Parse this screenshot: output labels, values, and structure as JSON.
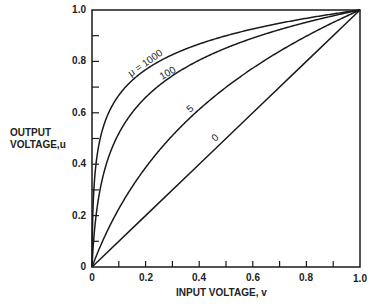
{
  "chart_data": {
    "type": "line",
    "title": "",
    "xlabel": "INPUT VOLTAGE, v",
    "ylabel_lines": [
      "OUTPUT",
      "VOLTAGE,u"
    ],
    "ylabel": "OUTPUT VOLTAGE,u",
    "xlim": [
      0,
      1.0
    ],
    "ylim": [
      0,
      1.0
    ],
    "grid": false,
    "legend": "inline curve labels",
    "x_ticks": [
      "0",
      "0.2",
      "0.4",
      "0.6",
      "0.8",
      "1.0"
    ],
    "y_ticks": [
      "0",
      "0.2",
      "0.4",
      "0.6",
      "0.8",
      "1.0"
    ],
    "minor_tick_step": 0.1,
    "series": [
      {
        "name": "0",
        "label": "0",
        "mu": 0,
        "x": [
          0,
          0.2,
          0.4,
          0.6,
          0.8,
          1.0
        ],
        "y": [
          0,
          0.2,
          0.4,
          0.6,
          0.8,
          1.0
        ]
      },
      {
        "name": "5",
        "label": "5",
        "mu": 5,
        "x": [
          0,
          0.05,
          0.1,
          0.2,
          0.3,
          0.4,
          0.5,
          0.6,
          0.7,
          0.8,
          0.9,
          1.0
        ],
        "y": [
          0,
          0.126,
          0.226,
          0.387,
          0.511,
          0.613,
          0.699,
          0.774,
          0.84,
          0.898,
          0.951,
          1.0
        ]
      },
      {
        "name": "100",
        "label": "100",
        "mu": 100,
        "x": [
          0,
          0.005,
          0.01,
          0.02,
          0.05,
          0.1,
          0.2,
          0.3,
          0.4,
          0.5,
          0.6,
          0.7,
          0.8,
          0.9,
          1.0
        ],
        "y": [
          0,
          0.088,
          0.15,
          0.238,
          0.388,
          0.52,
          0.66,
          0.742,
          0.805,
          0.852,
          0.891,
          0.923,
          0.952,
          0.977,
          1.0
        ]
      },
      {
        "name": "1000",
        "label": "μ = 1000",
        "mu": 1000,
        "x": [
          0,
          0.001,
          0.003,
          0.005,
          0.01,
          0.02,
          0.05,
          0.1,
          0.2,
          0.3,
          0.4,
          0.5,
          0.6,
          0.7,
          0.8,
          0.9,
          1.0
        ],
        "y": [
          0,
          0.1,
          0.201,
          0.259,
          0.347,
          0.441,
          0.569,
          0.668,
          0.768,
          0.826,
          0.868,
          0.9,
          0.926,
          0.949,
          0.968,
          0.985,
          1.0
        ]
      }
    ],
    "annotations": [
      {
        "text": "μ = 1000",
        "series": "1000"
      },
      {
        "text": "100",
        "series": "100"
      },
      {
        "text": "5",
        "series": "5"
      },
      {
        "text": "0",
        "series": "0"
      }
    ]
  },
  "labels": {
    "ylabel_line1": "OUTPUT",
    "ylabel_line2": "VOLTAGE,u",
    "xlabel": "INPUT VOLTAGE, v",
    "curve_1000": "μ = 1000",
    "curve_100": "100",
    "curve_5": "5",
    "curve_0": "0",
    "x_tick_0": "0",
    "x_tick_1": "0.2",
    "x_tick_2": "0.4",
    "x_tick_3": "0.6",
    "x_tick_4": "0.8",
    "x_tick_5": "1.0",
    "y_tick_0": "0",
    "y_tick_1": "0.2",
    "y_tick_2": "0.4",
    "y_tick_3": "0.6",
    "y_tick_4": "0.8",
    "y_tick_5": "1.0"
  },
  "colors": {
    "line": "#1a1a1a",
    "background": "#ffffff"
  }
}
